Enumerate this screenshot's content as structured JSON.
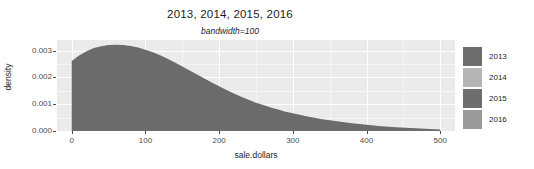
{
  "chart_data": {
    "type": "area",
    "title": "2013, 2014, 2015, 2016",
    "subtitle": "bandwidth=100",
    "xlabel": "sale.dollars",
    "ylabel": "density",
    "xlim": [
      -20,
      520
    ],
    "ylim": [
      0,
      0.0034
    ],
    "grid": true,
    "legend_position": "right",
    "xticks": [
      0,
      100,
      200,
      300,
      400,
      500
    ],
    "xtick_labels": [
      "0",
      "100",
      "200",
      "300",
      "400",
      "500"
    ],
    "yticks": [
      0.0,
      0.001,
      0.002,
      0.003
    ],
    "ytick_labels": [
      "0.000",
      "0.001",
      "0.002",
      "0.003"
    ],
    "legend": [
      {
        "label": "2013",
        "color": "#6e6e6e"
      },
      {
        "label": "2014",
        "color": "#b5b5b5"
      },
      {
        "label": "2015",
        "color": "#6e6e6e"
      },
      {
        "label": "2016",
        "color": "#9a9a9a"
      }
    ],
    "series": [
      {
        "name": "density",
        "fill": "#6b6b6b",
        "x": [
          0,
          10,
          20,
          30,
          40,
          50,
          60,
          70,
          80,
          90,
          100,
          110,
          120,
          130,
          140,
          150,
          160,
          170,
          180,
          190,
          200,
          210,
          220,
          230,
          240,
          250,
          260,
          270,
          280,
          290,
          300,
          320,
          340,
          360,
          380,
          400,
          420,
          440,
          460,
          480,
          500
        ],
        "y": [
          0.00262,
          0.00282,
          0.00298,
          0.0031,
          0.00317,
          0.00321,
          0.00322,
          0.00321,
          0.00318,
          0.00312,
          0.00304,
          0.00294,
          0.00283,
          0.0027,
          0.00256,
          0.00241,
          0.00226,
          0.00211,
          0.00196,
          0.00181,
          0.00167,
          0.00153,
          0.0014,
          0.00128,
          0.00117,
          0.00106,
          0.00097,
          0.00088,
          0.0008,
          0.00072,
          0.00066,
          0.00054,
          0.00044,
          0.00036,
          0.00029,
          0.00023,
          0.00018,
          0.00014,
          0.00011,
          8e-05,
          6e-05
        ]
      }
    ]
  },
  "panel": {
    "background": "#ebebeb",
    "gridline_color": "#ffffff"
  }
}
